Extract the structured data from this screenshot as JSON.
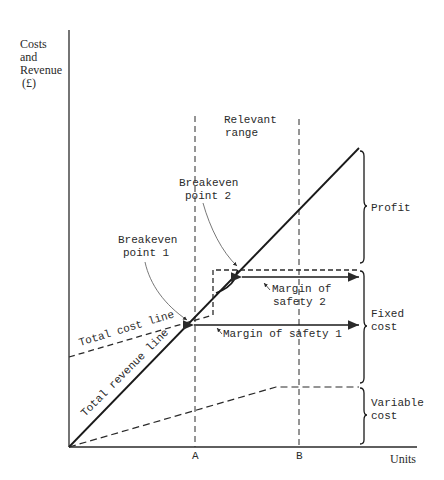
{
  "axes": {
    "y_label": [
      "Costs",
      "and",
      "Revenue",
      "(£)"
    ],
    "x_label": "Units",
    "x_ticks": [
      "A",
      "B"
    ]
  },
  "annotations": {
    "relevant_range": [
      "Relevant",
      "range"
    ],
    "breakeven_1": [
      "Breakeven",
      "point 1"
    ],
    "breakeven_2": [
      "Breakeven",
      "point 2"
    ],
    "margin_safety_1": "Margin of safety 1",
    "margin_safety_2": [
      "Margin of",
      "safety 2"
    ],
    "total_cost_line": "Total cost line",
    "total_revenue_line": "Total revenue line"
  },
  "braces": {
    "profit": [
      "Profit"
    ],
    "fixed_cost": [
      "Fixed",
      "cost"
    ],
    "variable_cost": [
      "Variable",
      "cost"
    ]
  },
  "colors": {
    "ink": "#2a2a2a",
    "background": "#ffffff"
  }
}
